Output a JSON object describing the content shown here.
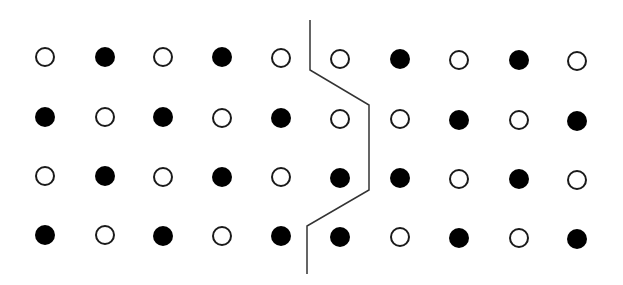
{
  "diagram": {
    "type": "dot-lattice-with-domain-boundary",
    "width": 623,
    "height": 285,
    "colors": {
      "background": "#ffffff",
      "filled": "#000000",
      "outline": "#1a1a1a",
      "boundary": "#333333"
    },
    "dot_radius": 10,
    "columns_x": [
      45,
      105,
      163,
      222,
      281,
      340,
      400,
      459,
      519,
      577
    ],
    "rows": [
      {
        "y": [
          57,
          57,
          57,
          57,
          58,
          59,
          59,
          60,
          60,
          61
        ],
        "pattern": [
          "open",
          "filled",
          "open",
          "filled",
          "open",
          "open",
          "filled",
          "open",
          "filled",
          "open"
        ]
      },
      {
        "y": [
          117,
          117,
          117,
          118,
          118,
          119,
          119,
          120,
          120,
          121
        ],
        "pattern": [
          "filled",
          "open",
          "filled",
          "open",
          "filled",
          "open",
          "open",
          "filled",
          "open",
          "filled"
        ]
      },
      {
        "y": [
          176,
          176,
          177,
          177,
          177,
          178,
          178,
          179,
          179,
          180
        ],
        "pattern": [
          "open",
          "filled",
          "open",
          "filled",
          "open",
          "filled",
          "filled",
          "open",
          "filled",
          "open"
        ]
      },
      {
        "y": [
          235,
          235,
          236,
          236,
          236,
          237,
          237,
          238,
          238,
          239
        ],
        "pattern": [
          "filled",
          "open",
          "filled",
          "open",
          "filled",
          "filled",
          "open",
          "filled",
          "open",
          "filled"
        ]
      }
    ],
    "boundary_line": {
      "points": [
        [
          310,
          20
        ],
        [
          310,
          70
        ],
        [
          369,
          105
        ],
        [
          369,
          190
        ],
        [
          307,
          226
        ],
        [
          307,
          274
        ]
      ],
      "stroke_width": 1.5
    }
  }
}
